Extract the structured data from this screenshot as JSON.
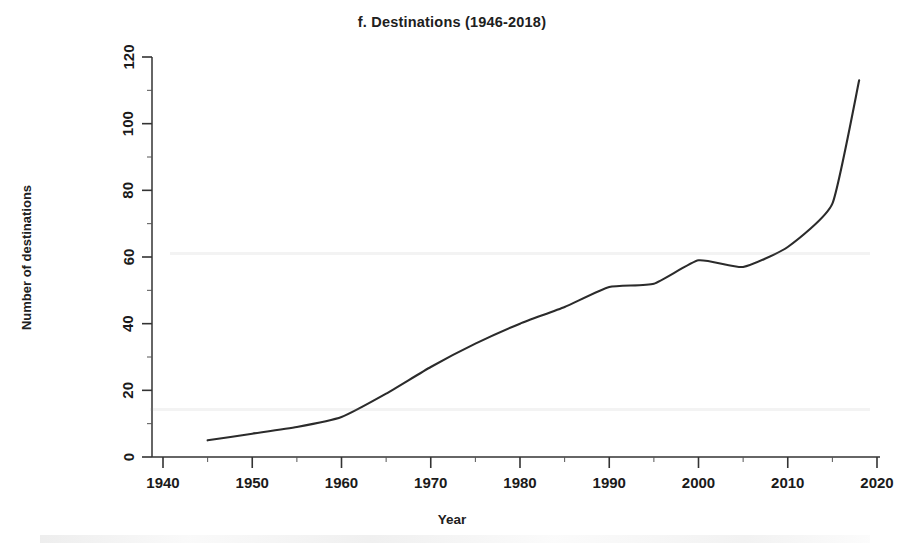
{
  "figure": {
    "panel_letter": "f.",
    "title": "f. Destinations (1946-2018)",
    "background_color": "#ffffff",
    "line_color": "#2b2b2b",
    "axis_color": "#333333"
  },
  "axes": {
    "x_title": "Year",
    "y_title": "Number of destinations",
    "x_ticks": [
      "1940",
      "1950",
      "1960",
      "1970",
      "1980",
      "1990",
      "2000",
      "2010",
      "2020"
    ],
    "y_ticks": [
      "0",
      "20",
      "40",
      "60",
      "80",
      "100",
      "120"
    ]
  },
  "chart_data": {
    "type": "line",
    "title": "f. Destinations (1946-2018)",
    "xlabel": "Year",
    "ylabel": "Number of destinations",
    "xlim": [
      1938,
      2022
    ],
    "ylim": [
      0,
      120
    ],
    "xticks": [
      1940,
      1950,
      1960,
      1970,
      1980,
      1990,
      2000,
      2010,
      2020
    ],
    "yticks": [
      0,
      20,
      40,
      60,
      80,
      100,
      120
    ],
    "grid": false,
    "legend": null,
    "series": [
      {
        "name": "Number of destinations",
        "color": "#2b2b2b",
        "x": [
          1945,
          1950,
          1955,
          1960,
          1965,
          1970,
          1975,
          1980,
          1985,
          1990,
          1995,
          2000,
          2005,
          2010,
          2015,
          2018
        ],
        "y": [
          5,
          7,
          9,
          12,
          19,
          27,
          34,
          40,
          45,
          51,
          52,
          59,
          57,
          63,
          76,
          113
        ]
      }
    ]
  }
}
